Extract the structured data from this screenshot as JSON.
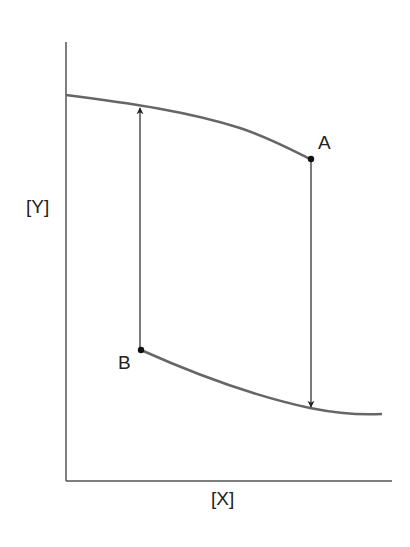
{
  "diagram": {
    "axes": {
      "x_label": "[X]",
      "y_label": "[Y]"
    },
    "points": [
      {
        "name": "A",
        "label": "A"
      },
      {
        "name": "B",
        "label": "B"
      }
    ],
    "curves": [
      {
        "name": "upper-curve",
        "description": "decreasing curve from top-left to point A"
      },
      {
        "name": "lower-curve",
        "description": "decreasing curve from point B flattening to the right"
      }
    ],
    "arrows": [
      {
        "name": "arrow-up",
        "from": "B",
        "to": "upper-curve"
      },
      {
        "name": "arrow-down",
        "from": "A",
        "to": "lower-curve"
      }
    ],
    "colors": {
      "curve": "#666666",
      "axis": "#555555",
      "arrow": "#222222",
      "point": "#111111"
    }
  }
}
